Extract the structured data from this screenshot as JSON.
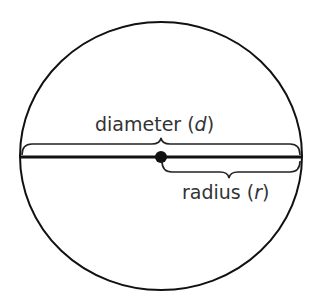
{
  "diagram": {
    "labels": {
      "diameter_text": "diameter (",
      "diameter_var": "d",
      "diameter_close": ")",
      "radius_text": "radius (",
      "radius_var": "r",
      "radius_close": ")"
    },
    "colors": {
      "stroke": "#111111",
      "text": "#333333"
    }
  }
}
